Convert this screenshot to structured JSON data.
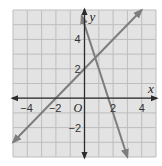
{
  "chart_data": {
    "type": "line",
    "title": "",
    "xlabel": "x",
    "ylabel": "y",
    "origin_label": "O",
    "xlim": [
      -5,
      5
    ],
    "ylim": [
      -4,
      6
    ],
    "grid": true,
    "x_ticks": [
      {
        "value": -4,
        "label": "−4"
      },
      {
        "value": -2,
        "label": "−2"
      },
      {
        "value": 2,
        "label": "2"
      },
      {
        "value": 4,
        "label": "4"
      }
    ],
    "y_ticks": [
      {
        "value": 4,
        "label": "4"
      },
      {
        "value": 2,
        "label": "2"
      },
      {
        "value": -2,
        "label": "−2"
      }
    ],
    "series": [
      {
        "name": "line-positive-slope",
        "equation": "y = x + 2",
        "x": [
          -5,
          4
        ],
        "y": [
          -3,
          6
        ],
        "arrows": "both"
      },
      {
        "name": "line-negative-slope",
        "equation": "y = -3x + 5",
        "x": [
          -0.2,
          3
        ],
        "y": [
          5.6,
          -4
        ],
        "arrows": "both"
      }
    ],
    "intersection": {
      "x": 0.75,
      "y": 2.75
    }
  },
  "colors": {
    "background": "#e3e3e3",
    "grid": "#bdbdbd",
    "axis": "#2b2b2b",
    "line": "#7d7d7d"
  }
}
